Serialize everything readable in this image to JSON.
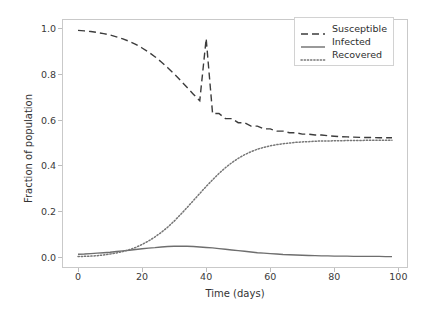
{
  "chart_data": {
    "type": "line",
    "title": "",
    "xlabel": "Time (days)",
    "ylabel": "Fraction of population",
    "xlim": [
      -5,
      103
    ],
    "ylim": [
      -0.05,
      1.04
    ],
    "grid": false,
    "legend_position": "upper right",
    "xticks": [
      0,
      20,
      40,
      60,
      80,
      100
    ],
    "xtick_labels": [
      "0",
      "20",
      "40",
      "60",
      "80",
      "100"
    ],
    "yticks": [
      0.0,
      0.2,
      0.4,
      0.6,
      0.8,
      1.0
    ],
    "ytick_labels": [
      "0.0",
      "0.2",
      "0.4",
      "0.6",
      "0.8",
      "1.0"
    ],
    "x": [
      0,
      2,
      4,
      6,
      8,
      10,
      12,
      14,
      16,
      18,
      20,
      22,
      24,
      26,
      28,
      30,
      32,
      34,
      36,
      38,
      40,
      42,
      44,
      46,
      48,
      50,
      52,
      54,
      56,
      58,
      60,
      62,
      64,
      66,
      68,
      70,
      72,
      74,
      76,
      78,
      80,
      82,
      84,
      86,
      88,
      90,
      92,
      94,
      96,
      98
    ],
    "series": [
      {
        "name": "Susceptible",
        "linestyle": "dashed",
        "color": "#3c3c3c",
        "values": [
          0.99,
          0.988,
          0.985,
          0.981,
          0.976,
          0.97,
          0.962,
          0.953,
          0.942,
          0.929,
          0.913,
          0.895,
          0.875,
          0.852,
          0.827,
          0.8,
          0.771,
          0.741,
          0.711,
          0.682,
          0.954,
          0.626,
          0.626,
          0.604,
          0.604,
          0.586,
          0.586,
          0.571,
          0.571,
          0.559,
          0.559,
          0.549,
          0.549,
          0.542,
          0.542,
          0.536,
          0.536,
          0.532,
          0.532,
          0.529,
          0.527,
          0.525,
          0.524,
          0.523,
          0.522,
          0.521,
          0.521,
          0.52,
          0.52,
          0.52
        ]
      },
      {
        "name": "Infected",
        "linestyle": "solid",
        "color": "#6e6e6e",
        "values": [
          0.01,
          0.011,
          0.013,
          0.015,
          0.017,
          0.019,
          0.022,
          0.025,
          0.028,
          0.031,
          0.034,
          0.037,
          0.039,
          0.042,
          0.044,
          0.045,
          0.045,
          0.045,
          0.044,
          0.042,
          0.04,
          0.038,
          0.035,
          0.032,
          0.029,
          0.026,
          0.023,
          0.02,
          0.017,
          0.015,
          0.013,
          0.011,
          0.009,
          0.008,
          0.007,
          0.006,
          0.005,
          0.004,
          0.003,
          0.003,
          0.002,
          0.002,
          0.002,
          0.001,
          0.001,
          0.001,
          0.001,
          0.001,
          0.0,
          0.0
        ]
      },
      {
        "name": "Recovered",
        "linestyle": "dotted",
        "color": "#767676",
        "values": [
          0.0,
          0.001,
          0.002,
          0.004,
          0.007,
          0.011,
          0.016,
          0.022,
          0.03,
          0.04,
          0.053,
          0.068,
          0.086,
          0.106,
          0.129,
          0.155,
          0.184,
          0.214,
          0.245,
          0.276,
          0.307,
          0.336,
          0.364,
          0.389,
          0.411,
          0.43,
          0.446,
          0.459,
          0.47,
          0.478,
          0.485,
          0.49,
          0.494,
          0.497,
          0.5,
          0.502,
          0.503,
          0.505,
          0.506,
          0.506,
          0.507,
          0.507,
          0.508,
          0.508,
          0.508,
          0.509,
          0.509,
          0.509,
          0.509,
          0.509
        ]
      }
    ]
  },
  "legend": {
    "entries": [
      {
        "label": "Susceptible",
        "style": "dashed"
      },
      {
        "label": "Infected",
        "style": "solid"
      },
      {
        "label": "Recovered",
        "style": "dotted"
      }
    ]
  },
  "axis": {
    "x_label": "Time (days)",
    "y_label": "Fraction of population"
  }
}
